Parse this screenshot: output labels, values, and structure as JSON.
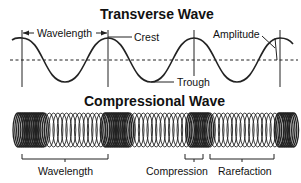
{
  "transverse": {
    "title": "Transverse Wave",
    "labels": {
      "wavelength": "Wavelength",
      "crest": "Crest",
      "trough": "Trough",
      "amplitude": "Amplitude"
    }
  },
  "compressional": {
    "title": "Compressional Wave",
    "labels": {
      "wavelength": "Wavelength",
      "compression": "Compression",
      "rarefaction": "Rarefaction"
    }
  },
  "colors": {
    "line": "#111111",
    "background": "#ffffff"
  }
}
